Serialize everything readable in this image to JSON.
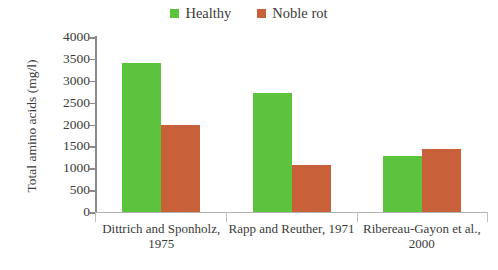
{
  "chart_data": {
    "type": "bar",
    "title": "",
    "xlabel": "",
    "ylabel": "Total amino acids (mg/l)",
    "categories": [
      "Dittrich and Sponholz, 1975",
      "Rapp and Reuther, 1971",
      "Ribereau-Gayon et al., 2000"
    ],
    "series": [
      {
        "name": "Healthy",
        "values": [
          3400,
          2720,
          1280
        ],
        "color": "#5CC33C"
      },
      {
        "name": "Noble rot",
        "values": [
          1990,
          1080,
          1440
        ],
        "color": "#C8603A"
      }
    ],
    "ylim": [
      0,
      4000
    ],
    "ytick_values": [
      4000,
      3500,
      3000,
      2500,
      2000,
      1500,
      1000,
      500,
      0
    ],
    "ytick_labels": [
      "4000",
      "3500",
      "3000",
      "2500",
      "2000",
      "1500",
      "1000",
      "500",
      "0"
    ],
    "grid": false,
    "legend_position": "top-center"
  },
  "legend": {
    "entries": [
      {
        "label": "Healthy",
        "color": "#5CC33C"
      },
      {
        "label": "Noble rot",
        "color": "#C8603A"
      }
    ]
  },
  "axes": {
    "y_title": "Total amino acids (mg/l)",
    "category_labels": [
      "Dittrich and Sponholz, 1975",
      "Rapp and Reuther, 1971",
      "Ribereau-Gayon et al., 2000"
    ]
  },
  "colors": {
    "healthy": "#5CC33C",
    "noble_rot": "#C8603A",
    "axis": "#8a8a8a",
    "text": "#3b3b3b",
    "background": "#ffffff"
  }
}
